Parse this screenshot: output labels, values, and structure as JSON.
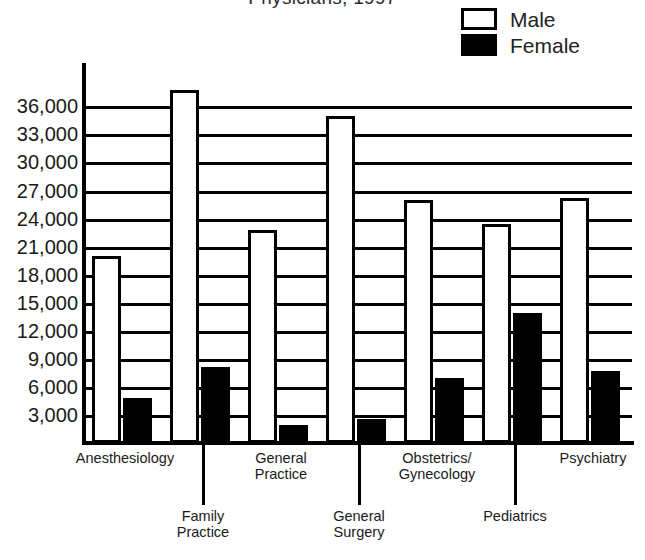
{
  "chart_data": {
    "type": "bar",
    "title": "Physicians, 1997",
    "categories": [
      "Anesthesiology",
      "Family Practice",
      "General Practice",
      "General Surgery",
      "Obstetrics/Gynecology",
      "Pediatrics",
      "Psychiatry"
    ],
    "series": [
      {
        "name": "Male",
        "color": "#ffffff",
        "values": [
          20000,
          37800,
          22800,
          35000,
          26000,
          23400,
          26200
        ]
      },
      {
        "name": "Female",
        "color": "#000000",
        "values": [
          4800,
          8100,
          1900,
          2600,
          7000,
          13900,
          7700
        ]
      }
    ],
    "xlabel": "",
    "ylabel": "",
    "ylim": [
      0,
      38500
    ],
    "yticks": [
      3000,
      6000,
      9000,
      12000,
      15000,
      18000,
      21000,
      24000,
      27000,
      30000,
      33000,
      36000
    ],
    "ytick_labels": [
      "3,000",
      "6,000",
      "9,000",
      "12,000",
      "15,000",
      "18,000",
      "21,000",
      "24,000",
      "27,000",
      "30,000",
      "33,000",
      "36,000"
    ],
    "grid": true,
    "legend_position": "top-right"
  },
  "legend": {
    "entries": [
      {
        "label": "Male",
        "swatch": "male"
      },
      {
        "label": "Female",
        "swatch": "female"
      }
    ]
  },
  "category_labels": [
    {
      "text": "Anesthesiology",
      "row": 0
    },
    {
      "text": "Family\nPractice",
      "row": 1
    },
    {
      "text": "General\nPractice",
      "row": 0
    },
    {
      "text": "General\nSurgery",
      "row": 1
    },
    {
      "text": "Obstetrics/\nGynecology",
      "row": 0
    },
    {
      "text": "Pediatrics",
      "row": 1
    },
    {
      "text": "Psychiatry",
      "row": 0
    }
  ]
}
